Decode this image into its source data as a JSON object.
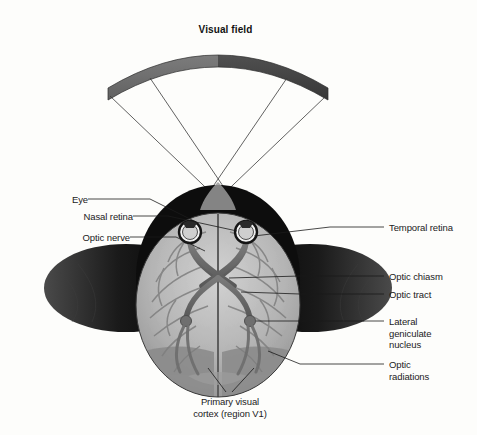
{
  "figure": {
    "title": "Visual field",
    "domain": "neuroanatomy-diagram",
    "background_color": "#fdfdfb",
    "ink_color": "#1b1b1b"
  },
  "visual_field": {
    "label": "Visual field",
    "left_half_color": "#6e6e6e",
    "right_half_color": "#434343",
    "arc_left_x": 108,
    "arc_right_x": 327,
    "arc_top_y": 50,
    "arc_end_y": 100
  },
  "anatomy": {
    "head_color": "#111111",
    "brain_color": "#b8b8b8",
    "brain_shadow_color": "#8f8f8f",
    "v1_color": "#8a8a8a",
    "nerve_color": "#6a6a6a",
    "eye_ring_color": "#1b1b1b",
    "eye_fill_color": "#f2f2f2",
    "left_eye": {
      "cx": 190,
      "cy": 232
    },
    "right_eye": {
      "cx": 246,
      "cy": 232
    },
    "chiasm": {
      "cx": 218,
      "cy": 278
    },
    "lgn_left": {
      "cx": 186,
      "cy": 320
    },
    "lgn_right": {
      "cx": 250,
      "cy": 320
    }
  },
  "labels": {
    "left": [
      {
        "name": "eye",
        "text": "Eye",
        "x": 82,
        "y": 195,
        "leader_to_x": 196,
        "leader_to_y": 222
      },
      {
        "name": "nasal-retina",
        "text": "Nasal retina",
        "x": 82,
        "y": 212,
        "leader_to_x": 235,
        "leader_to_y": 231
      },
      {
        "name": "optic-nerve",
        "text": "Optic nerve",
        "x": 82,
        "y": 233,
        "leader_to_x": 203,
        "leader_to_y": 252
      }
    ],
    "right": [
      {
        "name": "temporal-retina",
        "text": "Temporal retina",
        "x": 388,
        "y": 223,
        "leader_to_x": 253,
        "leader_to_y": 236
      },
      {
        "name": "optic-chiasm",
        "text": "Optic chiasm",
        "x": 388,
        "y": 272,
        "leader_to_x": 228,
        "leader_to_y": 278
      },
      {
        "name": "optic-tract",
        "text": "Optic tract",
        "x": 388,
        "y": 290,
        "leader_to_x": 240,
        "leader_to_y": 292
      },
      {
        "name": "lateral-geniculate-nucleus",
        "text": "Lateral\ngeniculate\nnucleus",
        "x": 388,
        "y": 316,
        "leader_to_x": 254,
        "leader_to_y": 321
      },
      {
        "name": "optic-radiations",
        "text": "Optic\nradiations",
        "x": 388,
        "y": 359,
        "leader_to_x": 268,
        "leader_to_y": 352
      }
    ],
    "bottom": [
      {
        "name": "primary-visual-cortex",
        "text": "Primary visual\ncortex (region V1)",
        "x": 230,
        "y": 398
      }
    ]
  }
}
